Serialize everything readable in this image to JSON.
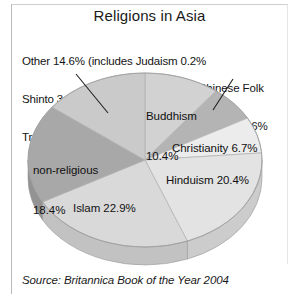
{
  "figure": {
    "title": "Religions in Asia",
    "source": "Source: Britannica Book of the Year 2004",
    "other_note_line1": "Other 14.6% (includes Judaism 0.2%",
    "other_note_line2": "Shinto 3.0%, Sikhism 0.6%",
    "other_note_line3": "Traditional 1.1%)",
    "chinese_folk_line1": "Chinese Folk",
    "chinese_folk_line2": "Religion 6.6%",
    "label_buddhism_line1": "Buddhism",
    "label_buddhism_line2": "10.4%",
    "label_nonreligious_line1": "non-religious",
    "label_nonreligious_line2": "18.4%",
    "label_christianity": "Christianity 6.7%",
    "label_hinduism": "Hinduism 20.4%",
    "label_islam": "Islam 22.9%"
  },
  "chart_data": {
    "type": "pie",
    "title": "Religions in Asia",
    "subtitle": "",
    "xlabel": "",
    "ylabel": "",
    "grid": false,
    "legend_position": "none",
    "style": "3d-pie",
    "units": "percent",
    "source": "Source: Britannica Book of the Year 2004",
    "categories": [
      "Buddhism",
      "Chinese Folk Religion",
      "Christianity",
      "Hinduism",
      "Islam",
      "non-religious",
      "Other"
    ],
    "values": [
      10.4,
      6.6,
      6.7,
      20.4,
      22.9,
      18.4,
      14.6
    ],
    "slice_colors": [
      "#d2d2d2",
      "#b4b4b4",
      "#ececec",
      "#e3e3e3",
      "#d9d9d9",
      "#a8a8a8",
      "#cacaca"
    ],
    "slice_side_colors": [
      "#bcbcbc",
      "#9e9e9e",
      "#d4d4d4",
      "#cccccc",
      "#c2c2c2",
      "#939393",
      "#b4b4b4"
    ],
    "annotations": [
      "Other 14.6% (includes Judaism 0.2%, Shinto 3.0%, Sikhism 0.6%, Traditional 1.1%)",
      "Chinese Folk Religion 6.6%"
    ],
    "other_breakdown": {
      "Judaism": 0.2,
      "Shinto": 3.0,
      "Sikhism": 0.6,
      "Traditional": 1.1
    }
  }
}
